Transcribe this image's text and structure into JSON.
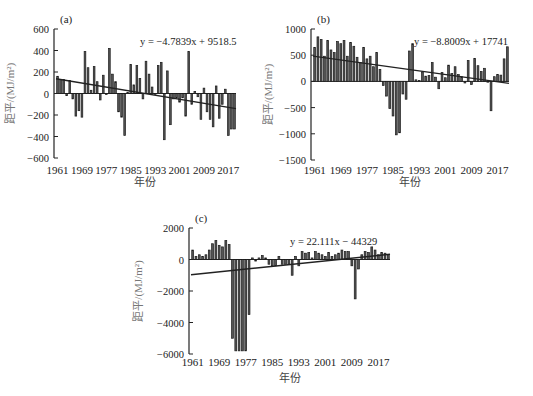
{
  "figure": {
    "panels": [
      "a",
      "b",
      "c"
    ]
  },
  "chart_data": [
    {
      "type": "bar",
      "panel_label": "(a)",
      "title": "",
      "xlabel": "年份",
      "ylabel": "距平/(MJ/m²)",
      "ylim": [
        -600,
        600
      ],
      "yticks": [
        600,
        400,
        200,
        0,
        -200,
        -400,
        -600
      ],
      "xticks": [
        "1961",
        "1969",
        "1977",
        "1985",
        "1993",
        "2001",
        "2009",
        "2017"
      ],
      "trend_equation": "y = −4.7839x + 9518.5",
      "trend": {
        "slope": -4.7839,
        "intercept": 9518.5
      },
      "grid": false,
      "x_start": 1961,
      "values": [
        160,
        130,
        130,
        -20,
        120,
        -50,
        -210,
        -160,
        -220,
        390,
        240,
        30,
        250,
        110,
        -60,
        170,
        -10,
        420,
        180,
        110,
        -170,
        -220,
        -390,
        10,
        270,
        80,
        260,
        140,
        -50,
        300,
        180,
        60,
        0,
        260,
        290,
        -430,
        210,
        -290,
        -50,
        -40,
        -80,
        -40,
        -210,
        390,
        -100,
        20,
        -30,
        -240,
        50,
        -170,
        -240,
        -310,
        70,
        -230,
        -100,
        40,
        -390,
        -330,
        -330
      ]
    },
    {
      "type": "bar",
      "panel_label": "(b)",
      "title": "",
      "xlabel": "年份",
      "ylabel": "距平/(MJ/m²)",
      "ylim": [
        -1500,
        1000
      ],
      "yticks": [
        1000,
        500,
        0,
        -500,
        -1000,
        -1500
      ],
      "xticks": [
        "1961",
        "1969",
        "1977",
        "1985",
        "1993",
        "2001",
        "2009",
        "2017"
      ],
      "trend_equation": "y = −8.8009x + 17741",
      "trend": {
        "slope": -8.8009,
        "intercept": 17741
      },
      "grid": false,
      "x_start": 1961,
      "values": [
        650,
        850,
        800,
        480,
        780,
        600,
        550,
        760,
        720,
        780,
        480,
        740,
        670,
        460,
        360,
        650,
        430,
        480,
        280,
        550,
        230,
        -80,
        -280,
        -520,
        -660,
        -1020,
        -980,
        -240,
        -340,
        580,
        720,
        30,
        20,
        180,
        100,
        110,
        360,
        80,
        -140,
        170,
        70,
        310,
        150,
        280,
        130,
        90,
        -30,
        400,
        -60,
        440,
        300,
        190,
        250,
        0,
        -560,
        90,
        130,
        120,
        430,
        660
      ]
    },
    {
      "type": "bar",
      "panel_label": "(c)",
      "title": "",
      "xlabel": "年份",
      "ylabel": "距平/(MJ/m²)",
      "ylim": [
        -6000,
        2000
      ],
      "yticks": [
        2000,
        0,
        -2000,
        -4000,
        -6000
      ],
      "xticks": [
        "1961",
        "1969",
        "1977",
        "1985",
        "1993",
        "2001",
        "2009",
        "2017"
      ],
      "trend_equation": "y = 22.111x − 44329",
      "trend": {
        "slope": 22.111,
        "intercept": -44329
      },
      "grid": false,
      "x_start": 1961,
      "values": [
        600,
        200,
        300,
        200,
        300,
        600,
        1000,
        1200,
        900,
        800,
        1200,
        950,
        -5000,
        -5800,
        -5800,
        -5800,
        -5800,
        -3500,
        100,
        -100,
        100,
        250,
        100,
        -300,
        -400,
        -400,
        200,
        -300,
        -300,
        -300,
        -1000,
        200,
        -400,
        500,
        400,
        450,
        100,
        500,
        400,
        300,
        200,
        450,
        200,
        300,
        400,
        600,
        500,
        500,
        -400,
        -2500,
        -600,
        300,
        500,
        450,
        800,
        600,
        300,
        450,
        400,
        300
      ]
    }
  ],
  "layout_hints": {
    "bar_color": "#1a1a1a",
    "bar_fill": "#555555",
    "trend_color": "#222222",
    "ylabel_color": "#777777"
  }
}
